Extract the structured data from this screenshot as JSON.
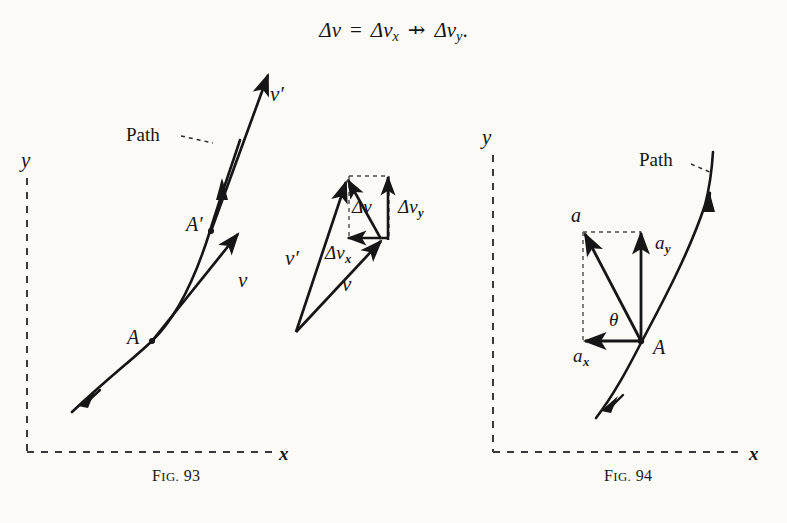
{
  "page": {
    "background": "#fbfaf7",
    "ink": "#161616"
  },
  "equation": {
    "lhs_delta": "Δ",
    "lhs_v": "v",
    "equals": "=",
    "term_x_delta": "Δ",
    "term_x_v": "v",
    "term_x_sub": "x",
    "operator": "⇸",
    "term_y_delta": "Δ",
    "term_y_v": "v",
    "term_y_sub": "y",
    "period": "."
  },
  "figures": [
    {
      "id": "fig-93",
      "caption_prefix": "F",
      "caption_smallcaps": "IG.",
      "caption_number": "93",
      "caption": "Fig. 93",
      "axis_y_label": "y",
      "axis_x_label": "x",
      "path_label": "Path",
      "points": [
        {
          "name": "A",
          "label": "A"
        },
        {
          "name": "A-prime",
          "label": "A′"
        }
      ],
      "vectors": [
        {
          "name": "v",
          "label": "v"
        },
        {
          "name": "v-prime",
          "label": "v′"
        }
      ]
    },
    {
      "id": "fig-94",
      "caption_prefix": "F",
      "caption_smallcaps": "IG.",
      "caption_number": "94",
      "caption": "Fig. 94",
      "axis_y_label": "y",
      "axis_x_label": "x",
      "path_label": "Path",
      "points": [
        {
          "name": "A",
          "label": "A"
        }
      ],
      "vectors": [
        {
          "name": "a",
          "label": "a"
        },
        {
          "name": "a-x",
          "label": "a",
          "sub": "x"
        },
        {
          "name": "a-y",
          "label": "a",
          "sub": "y"
        }
      ],
      "angle_label": "θ"
    }
  ],
  "vector_diagram": {
    "id": "velocity-change-triangle",
    "labels": {
      "v": "v",
      "v_prime": "v′",
      "delta_v": "Δv",
      "delta_v_x_main": "Δv",
      "delta_v_x_sub": "x",
      "delta_v_y_main": "Δv",
      "delta_v_y_sub": "y"
    }
  }
}
